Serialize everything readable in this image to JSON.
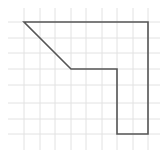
{
  "figure": {
    "width": 166,
    "height": 153,
    "background": "#ffffff",
    "grid": {
      "color": "#e2e2e2",
      "vertical_x": [
        24,
        40,
        55,
        71,
        86,
        102,
        117,
        133,
        148
      ],
      "vertical_y_range": [
        8,
        150
      ],
      "horizontal_y": [
        22,
        38,
        53,
        69,
        85,
        103,
        119,
        134
      ],
      "horizontal_x_range": [
        8,
        160
      ]
    },
    "shape": {
      "description": "L-shaped polygon with a slanted edge drawn on square grid",
      "stroke": "#555555",
      "stroke_width": 1.6,
      "vertices": [
        [
          24,
          22
        ],
        [
          148,
          22
        ],
        [
          148,
          134
        ],
        [
          117,
          134
        ],
        [
          117,
          69
        ],
        [
          71,
          69
        ]
      ]
    }
  }
}
